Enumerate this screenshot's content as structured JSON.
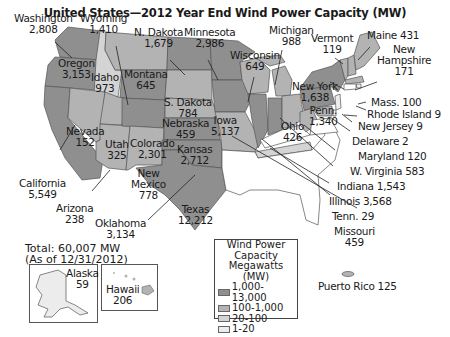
{
  "title": "United States—2012 Year End Wind Power Capacity (MW)",
  "total": {
    "line1": "Total: 60,007 MW",
    "line2": "(As of 12/31/2012)"
  },
  "colors": {
    "tier1": "#8f8f8f",
    "tier2": "#b3b3b3",
    "tier3": "#d4d4d4",
    "tier4": "#ececec",
    "none": "#ffffff",
    "border": "#555555"
  },
  "legend": {
    "title1": "Wind Power",
    "title2": "Capacity",
    "title3": "Megawatts (MW)",
    "items": [
      {
        "label": "1,000-13,000"
      },
      {
        "label": "100-1,000"
      },
      {
        "label": "20-100"
      },
      {
        "label": "1-20"
      }
    ]
  },
  "states": {
    "washington": {
      "name": "Washington",
      "value": "2,808"
    },
    "wyoming": {
      "name": "Wyoming",
      "value": "1,410"
    },
    "oregon": {
      "name": "Oregon",
      "value": "3,153"
    },
    "idaho": {
      "name": "Idaho",
      "value": "973"
    },
    "montana": {
      "name": "Montana",
      "value": "645"
    },
    "ndakota": {
      "name": "N. Dakota",
      "value": "1,679"
    },
    "minnesota": {
      "name": "Minnesota",
      "value": "2,986"
    },
    "wisconsin": {
      "name": "Wisconsin",
      "value": "649"
    },
    "michigan": {
      "name": "Michigan",
      "value": "988"
    },
    "vermont": {
      "name": "Vermont",
      "value": "119"
    },
    "maine": {
      "name": "Maine 431"
    },
    "newhampshire": {
      "name1": "New",
      "name2": "Hampshire",
      "value": "171"
    },
    "newyork": {
      "name": "New York",
      "value": "1,638"
    },
    "mass": {
      "name": "Mass. 100"
    },
    "rhodeisland": {
      "name": "Rhode Island 9"
    },
    "newjersey": {
      "name": "New Jersey 9"
    },
    "delaware": {
      "name": "Delaware 2"
    },
    "maryland": {
      "name": "Maryland 120"
    },
    "wvirginia": {
      "name": "W. Virginia 583"
    },
    "indiana": {
      "name": "Indiana 1,543"
    },
    "illinois": {
      "name": "Illinois 3,568"
    },
    "tenn": {
      "name": "Tenn. 29"
    },
    "missouri": {
      "name": "Missouri",
      "value": "459"
    },
    "penn": {
      "name": "Penn.",
      "value": "1,340"
    },
    "ohio": {
      "name": "Ohio",
      "value": "426"
    },
    "iowa": {
      "name": "Iowa",
      "value": "5,137"
    },
    "sdakota": {
      "name": "S. Dakota",
      "value": "784"
    },
    "nebraska": {
      "name": "Nebraska",
      "value": "459"
    },
    "kansas": {
      "name": "Kansas",
      "value": "2,712"
    },
    "colorado": {
      "name": "Colorado",
      "value": "2,301"
    },
    "utah": {
      "name": "Utah",
      "value": "325"
    },
    "nevada": {
      "name": "Nevada",
      "value": "152"
    },
    "california": {
      "name": "California",
      "value": "5,549"
    },
    "arizona": {
      "name": "Arizona",
      "value": "238"
    },
    "newmexico": {
      "name1": "New",
      "name2": "Mexico",
      "value": "778"
    },
    "oklahoma": {
      "name": "Oklahoma",
      "value": "3,134"
    },
    "texas": {
      "name": "Texas",
      "value": "12,212"
    },
    "alaska": {
      "name": "Alaska",
      "value": "59"
    },
    "hawaii": {
      "name": "Hawaii",
      "value": "206"
    },
    "puertorico": {
      "name": "Puerto Rico 125"
    }
  }
}
